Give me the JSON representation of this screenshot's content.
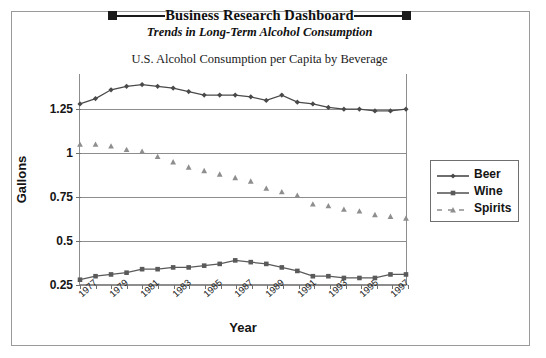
{
  "header": {
    "title": "Business Research Dashboard",
    "subtitle": "Trends in Long-Term Alcohol Consumption",
    "square_icon_left": "square-marker",
    "square_icon_right": "square-marker"
  },
  "chart_data": {
    "type": "line",
    "title": "U.S. Alcohol Consumption per Capita by Beverage",
    "xlabel": "Year",
    "ylabel": "Gallons",
    "ylim": [
      0.25,
      1.45
    ],
    "yticks": [
      "0.25",
      "0.5",
      "0.75",
      "1",
      "1.25"
    ],
    "ytick_values": [
      0.25,
      0.5,
      0.75,
      1,
      1.25
    ],
    "grid": "horizontal",
    "legend_position": "right",
    "x": [
      1977,
      1978,
      1979,
      1980,
      1981,
      1982,
      1983,
      1984,
      1985,
      1986,
      1987,
      1988,
      1989,
      1990,
      1991,
      1992,
      1993,
      1994,
      1995,
      1996,
      1997,
      1998
    ],
    "xtick_labels": [
      "1977",
      "1979",
      "1981",
      "1983",
      "1985",
      "1987",
      "1989",
      "1991",
      "1993",
      "1995",
      "1997"
    ],
    "series": [
      {
        "name": "Beer",
        "marker": "diamond",
        "line": "solid",
        "color": "#4a4a4a",
        "values": [
          1.28,
          1.31,
          1.36,
          1.38,
          1.39,
          1.38,
          1.37,
          1.35,
          1.33,
          1.33,
          1.33,
          1.32,
          1.3,
          1.33,
          1.29,
          1.28,
          1.26,
          1.25,
          1.25,
          1.24,
          1.24,
          1.25
        ]
      },
      {
        "name": "Wine",
        "marker": "square",
        "line": "solid",
        "color": "#5a5a5a",
        "values": [
          0.28,
          0.3,
          0.31,
          0.32,
          0.34,
          0.34,
          0.35,
          0.35,
          0.36,
          0.37,
          0.39,
          0.38,
          0.37,
          0.35,
          0.33,
          0.3,
          0.3,
          0.29,
          0.29,
          0.29,
          0.31,
          0.31
        ]
      },
      {
        "name": "Spirits",
        "marker": "triangle",
        "line": "dashed",
        "color": "#8e8e8e",
        "values": [
          1.05,
          1.05,
          1.04,
          1.02,
          1.01,
          0.98,
          0.95,
          0.92,
          0.9,
          0.88,
          0.86,
          0.84,
          0.8,
          0.78,
          0.76,
          0.71,
          0.7,
          0.68,
          0.67,
          0.65,
          0.64,
          0.63
        ]
      }
    ]
  }
}
